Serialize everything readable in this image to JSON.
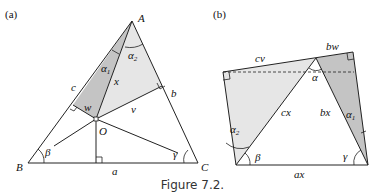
{
  "figure": {
    "caption": "Figure 7.2.",
    "panel_a": {
      "tag": "(a)",
      "vertices": {
        "A": "A",
        "B": "B",
        "C": "C",
        "O": "O"
      },
      "sides": {
        "a": "a",
        "b": "b",
        "c": "c"
      },
      "segments": {
        "x": "x",
        "v": "v",
        "w": "w"
      },
      "angles": {
        "alpha1": "α",
        "alpha1_sub": "1",
        "alpha2": "α",
        "alpha2_sub": "2",
        "beta": "β",
        "gamma": "γ"
      }
    },
    "panel_b": {
      "tag": "(b)",
      "sides": {
        "cv": "cv",
        "bw": "bw",
        "cx": "cx",
        "bx": "bx",
        "ax": "ax"
      },
      "angles": {
        "alpha": "α",
        "alpha1": "α",
        "alpha1_sub": "1",
        "alpha2": "α",
        "alpha2_sub": "2",
        "beta": "β",
        "gamma": "γ"
      }
    },
    "colors": {
      "light_shade": "#e6e6e6",
      "dark_shade": "#c4c4c4",
      "line": "#222222"
    }
  }
}
